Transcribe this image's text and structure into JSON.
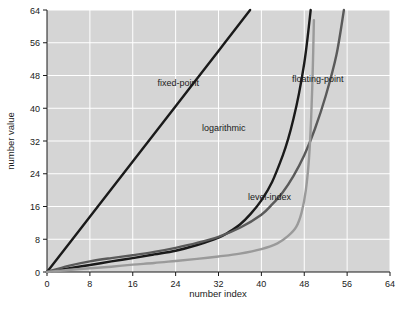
{
  "chart_data": {
    "type": "line",
    "title": "",
    "xlabel": "number index",
    "ylabel": "number value",
    "xlim": [
      0,
      64
    ],
    "ylim": [
      0,
      64
    ],
    "xticks": [
      0,
      8,
      16,
      24,
      32,
      40,
      48,
      56,
      64
    ],
    "yticks": [
      0,
      8,
      16,
      24,
      32,
      40,
      48,
      56,
      64
    ],
    "xtick_labels": [
      "0",
      "8",
      "16",
      "24",
      "32",
      "40",
      "48",
      "56",
      "64"
    ],
    "ytick_labels": [
      "0",
      "8",
      "16",
      "24",
      "32",
      "40",
      "48",
      "56",
      "64"
    ],
    "grid": true,
    "grid_color": "#ffffff",
    "plot_bgcolor": "#d5d5d5",
    "legend_position": "inline-annotations",
    "series": [
      {
        "name": "fixed-point",
        "color": "#1a1a1a",
        "width": 2.4,
        "label_x": 24.5,
        "label_y": 45.5,
        "points": [
          [
            0,
            0
          ],
          [
            8,
            13.5
          ],
          [
            16,
            27
          ],
          [
            24,
            40.5
          ],
          [
            32,
            54
          ],
          [
            37.9,
            64
          ]
        ]
      },
      {
        "name": "logarithmic",
        "color": "#1a1a1a",
        "width": 2.4,
        "label_x": 33.0,
        "label_y": 34.5,
        "points": [
          [
            0,
            0
          ],
          [
            4,
            0.9
          ],
          [
            8,
            1.7
          ],
          [
            12,
            2.6
          ],
          [
            16,
            3.4
          ],
          [
            20,
            4.3
          ],
          [
            24,
            5.2
          ],
          [
            28,
            6.6
          ],
          [
            32,
            8.4
          ],
          [
            34,
            9.8
          ],
          [
            36,
            11.6
          ],
          [
            38,
            14.2
          ],
          [
            40,
            17.5
          ],
          [
            42,
            22.0
          ],
          [
            44,
            28.5
          ],
          [
            45,
            32.5
          ],
          [
            46,
            37.5
          ],
          [
            47,
            43.5
          ],
          [
            48,
            51.0
          ],
          [
            48.6,
            57.0
          ],
          [
            49.2,
            64
          ]
        ]
      },
      {
        "name": "floating-point",
        "color": "#5a5a5a",
        "width": 2.4,
        "label_x": 50.5,
        "label_y": 46.5,
        "points": [
          [
            0,
            0
          ],
          [
            4,
            1.5
          ],
          [
            8,
            2.6
          ],
          [
            12,
            3.4
          ],
          [
            16,
            4.1
          ],
          [
            20,
            4.9
          ],
          [
            24,
            5.9
          ],
          [
            28,
            7.1
          ],
          [
            32,
            8.6
          ],
          [
            36,
            10.8
          ],
          [
            40,
            14.0
          ],
          [
            42,
            16.5
          ],
          [
            44,
            19.5
          ],
          [
            46,
            23.5
          ],
          [
            48,
            28.5
          ],
          [
            50,
            35.0
          ],
          [
            52,
            43.0
          ],
          [
            54,
            53.0
          ],
          [
            55.4,
            64
          ]
        ]
      },
      {
        "name": "level-index",
        "color": "#9a9a9a",
        "width": 2.4,
        "label_x": 41.5,
        "label_y": 17.5,
        "points": [
          [
            0,
            0
          ],
          [
            4,
            0.5
          ],
          [
            8,
            0.9
          ],
          [
            12,
            1.3
          ],
          [
            16,
            1.8
          ],
          [
            20,
            2.2
          ],
          [
            24,
            2.7
          ],
          [
            28,
            3.2
          ],
          [
            32,
            3.8
          ],
          [
            36,
            4.5
          ],
          [
            40,
            5.6
          ],
          [
            43,
            7.0
          ],
          [
            45,
            8.8
          ],
          [
            46.5,
            11.0
          ],
          [
            47.5,
            14.5
          ],
          [
            48.3,
            20.0
          ],
          [
            48.9,
            28.0
          ],
          [
            49.3,
            38.0
          ],
          [
            49.6,
            50.0
          ],
          [
            49.8,
            61.5
          ]
        ]
      }
    ]
  },
  "labels": {
    "fixed_point": "fixed-point",
    "logarithmic": "logarithmic",
    "floating_point": "floating-point",
    "level_index": "level-index"
  }
}
